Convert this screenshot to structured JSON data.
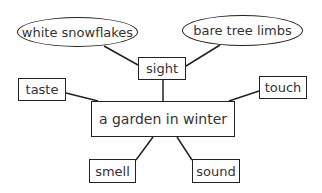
{
  "diagram": {
    "type": "web organizer",
    "center": {
      "label": "a garden in winter"
    },
    "senses": [
      {
        "id": "sight",
        "label": "sight"
      },
      {
        "id": "taste",
        "label": "taste"
      },
      {
        "id": "touch",
        "label": "touch"
      },
      {
        "id": "smell",
        "label": "smell"
      },
      {
        "id": "sound",
        "label": "sound"
      }
    ],
    "details": [
      {
        "parent": "sight",
        "label": "white snowflakes"
      },
      {
        "parent": "sight",
        "label": "bare tree limbs"
      }
    ],
    "colors": {
      "line": "#222222",
      "text": "#333333",
      "background": "#ffffff"
    }
  }
}
